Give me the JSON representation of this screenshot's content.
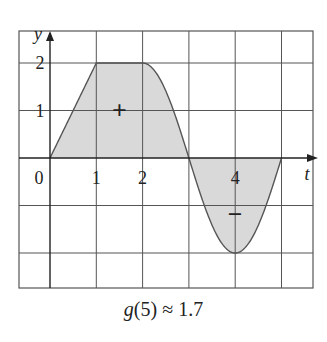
{
  "chart_data": {
    "type": "area",
    "title": "",
    "xlabel": "t",
    "ylabel": "y",
    "xlim": [
      -0.7,
      5.7
    ],
    "ylim": [
      -2.8,
      2.8
    ],
    "grid": true,
    "x_ticks": [
      {
        "value": 0,
        "label": "0"
      },
      {
        "value": 1,
        "label": "1"
      },
      {
        "value": 2,
        "label": "2"
      },
      {
        "value": 4,
        "label": "4"
      }
    ],
    "y_ticks": [
      {
        "value": 1,
        "label": "1"
      },
      {
        "value": 2,
        "label": "2"
      }
    ],
    "series": [
      {
        "name": "f(t)",
        "x": [
          0,
          0.5,
          1,
          1.5,
          2,
          2.25,
          2.5,
          2.75,
          3,
          3.25,
          3.5,
          3.75,
          4,
          4.25,
          4.5,
          4.75,
          5
        ],
        "values": [
          0,
          1,
          2,
          2,
          2,
          1.85,
          1.41,
          0.77,
          0,
          -0.77,
          -1.41,
          -1.85,
          -2,
          -1.85,
          -1.41,
          -0.77,
          0
        ]
      }
    ],
    "annotations": [
      {
        "text": "+",
        "x": 1.5,
        "y": 1,
        "meaning": "positive area"
      },
      {
        "text": "−",
        "x": 4,
        "y": -1.2,
        "meaning": "negative area"
      }
    ],
    "caption": {
      "func": "g",
      "arg": "(5)",
      "approx": "≈",
      "value": "1.7",
      "full": "g(5) ≈ 1.7"
    }
  },
  "colors": {
    "grid": "#555555",
    "fill": "#d9d9d9",
    "curve": "#555555",
    "axis": "#222222"
  }
}
